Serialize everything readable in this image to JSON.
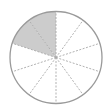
{
  "diagram": {
    "type": "fraction-circle",
    "total_slices": 10,
    "shaded_slices": 2,
    "shaded_start": "top, counter-clockwise",
    "fraction": "2/10",
    "colors": {
      "outline": "#9a9a9a",
      "divider": "#a8a8a8",
      "shade": "#cccccc",
      "background": "#ffffff"
    },
    "geometry": {
      "cx": 56,
      "cy": 57.5,
      "r": 46
    }
  }
}
